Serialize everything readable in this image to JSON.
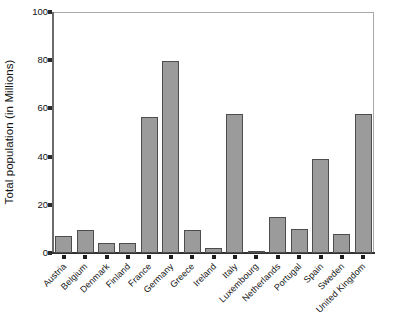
{
  "chart_data": {
    "type": "bar",
    "title": "",
    "subtitle": "",
    "xlabel": "",
    "ylabel": "Total population (in Millions)",
    "categories": [
      "Austria",
      "Belgium",
      "Denmark",
      "Finland",
      "France",
      "Germany",
      "Greece",
      "Ireland",
      "Italy",
      "Luxembourg",
      "Netherlands",
      "Portugal",
      "Spain",
      "Sweden",
      "United Kingdom"
    ],
    "values": [
      7.0,
      9.5,
      4.0,
      4.0,
      56.5,
      79.5,
      9.5,
      2.0,
      57.5,
      0.4,
      14.8,
      10.0,
      39.0,
      8.0,
      57.5
    ],
    "ylim": [
      0,
      100
    ],
    "yticks": [
      0,
      20,
      40,
      60,
      80,
      100
    ],
    "ytick_labels": [
      "0",
      "20",
      "40",
      "60",
      "80",
      "100"
    ],
    "grid": false,
    "legend": false,
    "legend_position": "none",
    "bar_fill_color": "#9b9b9b",
    "bar_edge_color": "#4d4d4d",
    "axis_color": "#333333",
    "frame_color": "#a8a8a8",
    "background_color": "#ffffff",
    "xtick_label_rotation": -45
  }
}
